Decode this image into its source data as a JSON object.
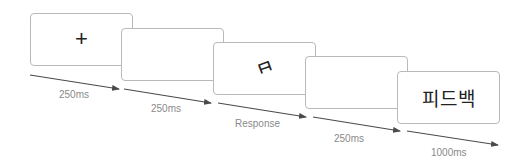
{
  "diagram": {
    "type": "trial-sequence",
    "screens": [
      {
        "id": "fixation",
        "content": "+"
      },
      {
        "id": "blank-1",
        "content": ""
      },
      {
        "id": "stimulus",
        "content": "ㅂ"
      },
      {
        "id": "blank-2",
        "content": ""
      },
      {
        "id": "feedback",
        "content": "피드백"
      }
    ],
    "durations": [
      {
        "label": "250ms"
      },
      {
        "label": "250ms"
      },
      {
        "label": "Response"
      },
      {
        "label": "250ms"
      },
      {
        "label": "1000ms"
      }
    ],
    "colors": {
      "border": "#b9b9b9",
      "arrow": "#4a4a4a",
      "label": "#8a8a8a",
      "text": "#222222"
    }
  }
}
